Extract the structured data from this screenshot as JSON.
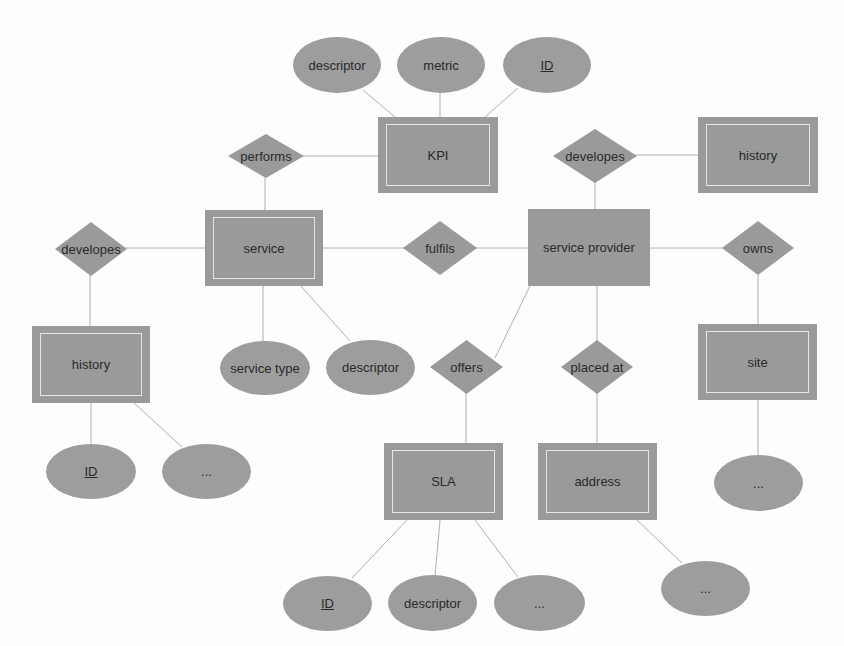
{
  "colors": {
    "shape_fill": "#9a9a9a",
    "line": "#b0b0b0",
    "inner_border": "#e6e6e6",
    "background": "#fdfdfd"
  },
  "entities": {
    "kpi": {
      "label": "KPI"
    },
    "history_top": {
      "label": "history"
    },
    "service": {
      "label": "service"
    },
    "service_provider": {
      "label": "service provider"
    },
    "history_left": {
      "label": "history"
    },
    "site": {
      "label": "site"
    },
    "sla": {
      "label": "SLA"
    },
    "address": {
      "label": "address"
    }
  },
  "relationships": {
    "performs": {
      "label": "performs"
    },
    "developes_top": {
      "label": "developes"
    },
    "developes_left": {
      "label": "developes"
    },
    "fulfils": {
      "label": "fulfils"
    },
    "owns": {
      "label": "owns"
    },
    "offers": {
      "label": "offers"
    },
    "placed_at": {
      "label": "placed at"
    }
  },
  "attributes": {
    "kpi_descriptor": {
      "label": "descriptor"
    },
    "kpi_metric": {
      "label": "metric"
    },
    "kpi_id": {
      "label": "ID"
    },
    "service_type": {
      "label": "service type"
    },
    "service_descriptor": {
      "label": "descriptor"
    },
    "history_id": {
      "label": "ID"
    },
    "history_more": {
      "label": "..."
    },
    "site_more": {
      "label": "..."
    },
    "sla_id": {
      "label": "ID"
    },
    "sla_descriptor": {
      "label": "descriptor"
    },
    "sla_more": {
      "label": "..."
    },
    "address_more": {
      "label": "..."
    }
  }
}
